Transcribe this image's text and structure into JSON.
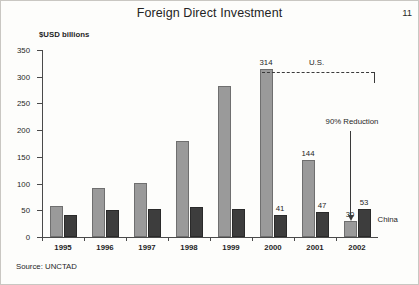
{
  "page": {
    "number": "11",
    "source_note": "Source: UNCTAD"
  },
  "chart_data": {
    "type": "bar",
    "title": "Foreign Direct Investment",
    "xlabel": "",
    "ylabel": "$USD billions",
    "ylim": [
      0,
      350
    ],
    "ytick_labels": [
      "0",
      "50",
      "100",
      "150",
      "200",
      "250",
      "300",
      "350"
    ],
    "ytick_values": [
      0,
      50,
      100,
      150,
      200,
      250,
      300,
      350
    ],
    "grid": false,
    "legend_position": "inline-annotation",
    "categories": [
      "1995",
      "1996",
      "1997",
      "1998",
      "1999",
      "2000",
      "2001",
      "2002"
    ],
    "series": [
      {
        "name": "U.S.",
        "color": "#9a9a9a",
        "values": [
          58,
          92,
          101,
          180,
          283,
          314,
          144,
          30
        ],
        "labels": [
          "",
          "",
          "",
          "",
          "",
          "314",
          "144",
          "30"
        ]
      },
      {
        "name": "China",
        "color": "#3d3d3d",
        "values": [
          42,
          50,
          52,
          56,
          52,
          41,
          47,
          53
        ],
        "labels": [
          "",
          "",
          "",
          "",
          "",
          "41",
          "47",
          "53"
        ]
      }
    ],
    "annotations": {
      "us_label": "U.S.",
      "china_label": "China",
      "reduction_label": "90% Reduction"
    }
  }
}
